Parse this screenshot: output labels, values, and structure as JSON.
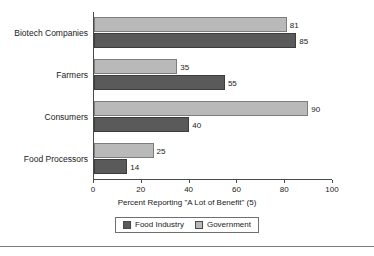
{
  "chart_data": {
    "type": "bar",
    "orientation": "horizontal",
    "title": "",
    "xlabel": "Percent Reporting \"A Lot of Benefit\" (5)",
    "ylabel": "",
    "xlim": [
      0,
      100
    ],
    "xticks": [
      0,
      20,
      40,
      60,
      80,
      100
    ],
    "xtick_labels": [
      "0",
      "20",
      "40",
      "60",
      "80",
      "100"
    ],
    "grid": false,
    "legend_position": "bottom-center",
    "categories": [
      "Biotech Companies",
      "Farmers",
      "Consumers",
      "Food Processors"
    ],
    "series": [
      {
        "name": "Government",
        "color": "#b9b9b9",
        "values": [
          81,
          35,
          90,
          25
        ],
        "labels": [
          "81",
          "35",
          "90",
          "25"
        ]
      },
      {
        "name": "Food Industry",
        "color": "#5a5a5a",
        "values": [
          85,
          55,
          40,
          14
        ],
        "labels": [
          "85",
          "55",
          "40",
          "14"
        ]
      }
    ]
  },
  "legend": {
    "items": [
      {
        "label": "Food Industry",
        "swatch": "dark",
        "color": "#5a5a5a"
      },
      {
        "label": "Government",
        "swatch": "light",
        "color": "#b9b9b9"
      }
    ]
  },
  "axis": {
    "x_title": "Percent Reporting \"A Lot of Benefit\" (5)"
  }
}
